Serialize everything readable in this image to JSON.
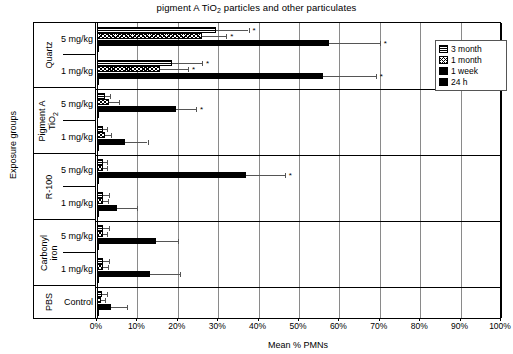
{
  "chart_data": {
    "type": "bar",
    "orientation": "horizontal",
    "title": "pigment A TiO2 particles and other particulates",
    "title_parts": {
      "pre": "pigment A TiO",
      "sub": "2",
      "post": " particles and other particulates"
    },
    "xlabel": "Mean % PMNs",
    "ylabel": "Exposure groups",
    "xlim": [
      0,
      100
    ],
    "xticks": [
      "0%",
      "10%",
      "20%",
      "30%",
      "40%",
      "50%",
      "60%",
      "70%",
      "80%",
      "90%",
      "100%"
    ],
    "xtick_values": [
      0,
      10,
      20,
      30,
      40,
      50,
      60,
      70,
      80,
      90,
      100
    ],
    "grid": "vertical",
    "legend_position": "top-right",
    "legend": [
      {
        "label": "3 month",
        "pattern": "horizontal-lines"
      },
      {
        "label": "1 month",
        "pattern": "cross-hatch"
      },
      {
        "label": "1 week",
        "pattern": "solid-black"
      },
      {
        "label": "24 h",
        "pattern": "solid-black"
      }
    ],
    "series_order": [
      "3 month",
      "1 month",
      "1 week",
      "24 h"
    ],
    "groups": [
      {
        "material": "Quartz",
        "doses": [
          {
            "dose": "5 mg/kg",
            "bars": [
              {
                "series": "3 month",
                "value": 29.5,
                "error": 8.0,
                "star": true
              },
              {
                "series": "1 month",
                "value": 26.0,
                "error": 6.0,
                "star": true
              },
              {
                "series": "1 week",
                "value": 57.5,
                "error": 12.5,
                "star": true
              },
              {
                "series": "24 h",
                "value": 0,
                "error": 0,
                "star": false
              }
            ]
          },
          {
            "dose": "1 mg/kg",
            "bars": [
              {
                "series": "3 month",
                "value": 18.5,
                "error": 7.5,
                "star": true
              },
              {
                "series": "1 month",
                "value": 15.5,
                "error": 7.0,
                "star": true
              },
              {
                "series": "1 week",
                "value": 56.0,
                "error": 13.0,
                "star": true
              },
              {
                "series": "24 h",
                "value": 0,
                "error": 0,
                "star": false
              }
            ]
          }
        ]
      },
      {
        "material": "Pigment A TiO2",
        "material_parts": {
          "line1": "Pigment A",
          "line2": "TiO",
          "sub": "2"
        },
        "doses": [
          {
            "dose": "5 mg/kg",
            "bars": [
              {
                "series": "3 month",
                "value": 2.0,
                "error": 1.2,
                "star": false
              },
              {
                "series": "1 month",
                "value": 3.0,
                "error": 2.5,
                "star": false
              },
              {
                "series": "1 week",
                "value": 19.5,
                "error": 5.0,
                "star": true
              },
              {
                "series": "24 h",
                "value": 0,
                "error": 0,
                "star": false
              }
            ]
          },
          {
            "dose": "1 mg/kg",
            "bars": [
              {
                "series": "3 month",
                "value": 1.5,
                "error": 1.0,
                "star": false
              },
              {
                "series": "1 month",
                "value": 2.0,
                "error": 1.5,
                "star": false
              },
              {
                "series": "1 week",
                "value": 7.0,
                "error": 5.5,
                "star": false
              },
              {
                "series": "24 h",
                "value": 0,
                "error": 0,
                "star": false
              }
            ]
          }
        ]
      },
      {
        "material": "R-100",
        "doses": [
          {
            "dose": "5 mg/kg",
            "bars": [
              {
                "series": "3 month",
                "value": 1.5,
                "error": 1.0,
                "star": false
              },
              {
                "series": "1 month",
                "value": 1.5,
                "error": 1.0,
                "star": false
              },
              {
                "series": "1 week",
                "value": 37.0,
                "error": 9.5,
                "star": true
              },
              {
                "series": "24 h",
                "value": 0,
                "error": 0,
                "star": false
              }
            ]
          },
          {
            "dose": "1 mg/kg",
            "bars": [
              {
                "series": "3 month",
                "value": 1.5,
                "error": 1.5,
                "star": false
              },
              {
                "series": "1 month",
                "value": 1.5,
                "error": 1.2,
                "star": false
              },
              {
                "series": "1 week",
                "value": 5.0,
                "error": 5.0,
                "star": false
              },
              {
                "series": "24 h",
                "value": 0,
                "error": 0,
                "star": false
              }
            ]
          }
        ]
      },
      {
        "material": "Carbonyl iron",
        "material_parts": {
          "line1": "Carbonyl",
          "line2": "iron"
        },
        "doses": [
          {
            "dose": "5 mg/kg",
            "bars": [
              {
                "series": "3 month",
                "value": 1.5,
                "error": 1.5,
                "star": false
              },
              {
                "series": "1 month",
                "value": 1.5,
                "error": 1.0,
                "star": false
              },
              {
                "series": "1 week",
                "value": 14.5,
                "error": 5.5,
                "star": false
              },
              {
                "series": "24 h",
                "value": 0,
                "error": 0,
                "star": false
              }
            ]
          },
          {
            "dose": "1 mg/kg",
            "bars": [
              {
                "series": "3 month",
                "value": 1.5,
                "error": 1.5,
                "star": false
              },
              {
                "series": "1 month",
                "value": 1.5,
                "error": 1.2,
                "star": false
              },
              {
                "series": "1 week",
                "value": 13.0,
                "error": 7.5,
                "star": false
              },
              {
                "series": "24 h",
                "value": 0,
                "error": 0,
                "star": false
              }
            ]
          }
        ]
      },
      {
        "material": "PBS",
        "doses": [
          {
            "dose": "Control",
            "bars": [
              {
                "series": "3 month",
                "value": 1.2,
                "error": 1.2,
                "star": false
              },
              {
                "series": "1 month",
                "value": 1.0,
                "error": 1.0,
                "star": false
              },
              {
                "series": "1 week",
                "value": 3.5,
                "error": 4.0,
                "star": false
              },
              {
                "series": "24 h",
                "value": 0,
                "error": 0,
                "star": false
              }
            ]
          }
        ]
      }
    ]
  }
}
